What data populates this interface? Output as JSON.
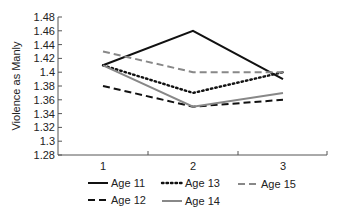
{
  "chart_data": {
    "type": "line",
    "title": "",
    "xlabel": "",
    "ylabel": "Violence as Manly",
    "x": [
      1,
      2,
      3
    ],
    "x_tick_labels": [
      "1",
      "2",
      "3"
    ],
    "ylim": [
      1.28,
      1.48
    ],
    "y_ticks": [
      "1.48",
      "1.46",
      "1.44",
      "1.42",
      "1.4",
      "1.38",
      "1.36",
      "1.34",
      "1.32",
      "1.3",
      "1.28"
    ],
    "grid": false,
    "legend_position": "bottom",
    "series": [
      {
        "name": "Age 11",
        "values": [
          1.41,
          1.46,
          1.39
        ],
        "color": "#111111",
        "style": "solid"
      },
      {
        "name": "Age 12",
        "values": [
          1.38,
          1.35,
          1.36
        ],
        "color": "#111111",
        "style": "dashed"
      },
      {
        "name": "Age 13",
        "values": [
          1.41,
          1.37,
          1.4
        ],
        "color": "#111111",
        "style": "dotted"
      },
      {
        "name": "Age 14",
        "values": [
          1.41,
          1.35,
          1.37
        ],
        "color": "#888888",
        "style": "solid"
      },
      {
        "name": "Age 15",
        "values": [
          1.43,
          1.4,
          1.4
        ],
        "color": "#888888",
        "style": "dashed"
      }
    ]
  },
  "legend": {
    "row1": [
      "Age 11",
      "Age 13",
      "Age 15"
    ],
    "row2": [
      "Age 12",
      "Age 14"
    ]
  }
}
